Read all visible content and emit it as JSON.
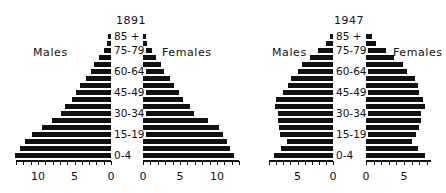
{
  "chart_data": [
    {
      "type": "bar",
      "subtype": "population-pyramid",
      "title": "1891",
      "left_label": "Males",
      "right_label": "Females",
      "categories": [
        "0-4",
        "5-9",
        "10-14",
        "15-19",
        "20-24",
        "25-29",
        "30-34",
        "35-39",
        "40-44",
        "45-49",
        "50-54",
        "55-59",
        "60-64",
        "65-69",
        "70-74",
        "75-79",
        "80-84",
        "85 +"
      ],
      "labeled_categories": [
        "0-4",
        "15-19",
        "30-34",
        "45-49",
        "60-64",
        "75-79",
        "85 +"
      ],
      "series": [
        {
          "name": "Males",
          "values": [
            13.2,
            12.5,
            11.8,
            10.8,
            9.4,
            8.1,
            6.9,
            6.3,
            5.4,
            4.8,
            4.2,
            3.4,
            2.8,
            2.3,
            1.7,
            1.0,
            0.6,
            0.4
          ]
        },
        {
          "name": "Females",
          "values": [
            12.3,
            11.8,
            11.3,
            10.8,
            10.3,
            8.8,
            6.9,
            6.3,
            5.4,
            4.9,
            4.2,
            3.6,
            2.9,
            2.4,
            1.8,
            1.2,
            0.6,
            0.4
          ]
        }
      ],
      "x_ticks_left": [
        "10",
        "5",
        "0"
      ],
      "x_ticks_right": [
        "0",
        "5",
        "10"
      ],
      "xlim": [
        0,
        13
      ],
      "xlabel": "",
      "ylabel": ""
    },
    {
      "type": "bar",
      "subtype": "population-pyramid",
      "title": "1947",
      "left_label": "Males",
      "right_label": "Females",
      "categories": [
        "0-4",
        "5-9",
        "10-14",
        "15-19",
        "20-24",
        "25-29",
        "30-34",
        "35-39",
        "40-44",
        "45-49",
        "50-54",
        "55-59",
        "60-64",
        "65-69",
        "70-74",
        "75-79",
        "80-84",
        "85 +"
      ],
      "labeled_categories": [
        "0-4",
        "15-19",
        "30-34",
        "45-49",
        "60-64",
        "75-79",
        "85 +"
      ],
      "series": [
        {
          "name": "Males",
          "values": [
            8.3,
            7.3,
            6.5,
            7.4,
            7.6,
            7.8,
            7.8,
            8.2,
            8.0,
            7.1,
            6.4,
            5.9,
            4.9,
            4.3,
            3.3,
            2.1,
            1.0,
            0.4
          ]
        },
        {
          "name": "Females",
          "values": [
            7.7,
            6.9,
            6.1,
            6.6,
            7.0,
            7.3,
            7.3,
            7.7,
            7.5,
            7.0,
            6.8,
            6.4,
            5.4,
            4.9,
            3.7,
            2.6,
            1.3,
            0.8
          ]
        }
      ],
      "x_ticks_left": [
        "5",
        "0"
      ],
      "x_ticks_right": [
        "0",
        "5"
      ],
      "xlim": [
        0,
        8.5
      ],
      "xlabel": "",
      "ylabel": ""
    }
  ]
}
